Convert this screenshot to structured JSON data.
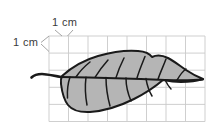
{
  "figure": {
    "background_color": "#ffffff"
  },
  "grid": {
    "label_horizontal": "1 cm",
    "label_vertical": "1 cm",
    "line_color": "#c9c9c9",
    "cell_size_px": 19.5,
    "columns": 8,
    "rows": 5,
    "origin_x": 49,
    "origin_y": 36,
    "unit": "cm"
  },
  "leader_lines": {
    "color": "#8a8a8a",
    "top_label_x": 49,
    "top_label_y": 26,
    "left_label_x": 16,
    "left_label_y": 45
  },
  "leaf": {
    "name": "leaf-outline",
    "fill_color": "#b5b5b5",
    "stroke_color": "#1a1a1a",
    "vein_color": "#1a1a1a",
    "midrib_label": "midrib",
    "petiole_label": "petiole",
    "vein_count": 10
  }
}
